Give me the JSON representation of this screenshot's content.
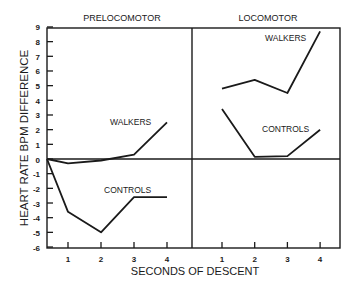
{
  "chart_data": {
    "type": "line",
    "ylabel": "HEART RATE BPM DIFFERENCE",
    "xlabel": "SECONDS OF DESCENT",
    "ylim": [
      -6,
      9
    ],
    "yticks": [
      9,
      8,
      7,
      6,
      5,
      4,
      3,
      2,
      1,
      0,
      -1,
      -2,
      -3,
      -4,
      -5,
      -6
    ],
    "panels": [
      {
        "title": "PRELOCOMOTOR",
        "x": [
          0,
          1,
          2,
          3,
          4
        ],
        "xticks": [
          "1",
          "2",
          "3",
          "4"
        ],
        "series": [
          {
            "name": "WALKERS",
            "values": [
              0,
              -0.3,
              -0.1,
              0.3,
              2.5
            ]
          },
          {
            "name": "CONTROLS",
            "values": [
              0,
              -3.6,
              -5.0,
              -2.6,
              -2.6
            ]
          }
        ]
      },
      {
        "title": "LOCOMOTOR",
        "x": [
          1,
          2,
          3,
          4
        ],
        "xticks": [
          "1",
          "2",
          "3",
          "4"
        ],
        "series": [
          {
            "name": "WALKERS",
            "values": [
              4.8,
              5.4,
              4.5,
              8.7
            ]
          },
          {
            "name": "CONTROLS",
            "values": [
              3.4,
              0.15,
              0.2,
              2.0
            ]
          }
        ]
      }
    ],
    "zero_line": true,
    "grid": false,
    "legend": "inline labels"
  }
}
